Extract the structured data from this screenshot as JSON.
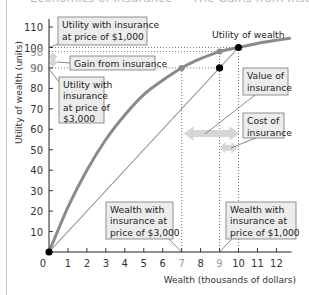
{
  "title_partial": "Economics of insurance — The Gains from Insurance",
  "chart_data": {
    "type": "line",
    "title": "The Gains from Insurance",
    "xlabel": "Wealth (thousands of dollars)",
    "ylabel": "Utility of wealth (units)",
    "xlim": [
      0,
      12.8
    ],
    "ylim": [
      0,
      115
    ],
    "x_ticks": [
      0,
      1,
      2,
      3,
      4,
      5,
      6,
      7,
      8,
      9,
      10,
      11,
      12
    ],
    "x_ticks_highlighted": [
      7,
      9
    ],
    "y_ticks": [
      10,
      20,
      30,
      40,
      50,
      60,
      70,
      80,
      90,
      100,
      110
    ],
    "y_ticks_highlighted": [
      90,
      98
    ],
    "grid": false,
    "series": [
      {
        "name": "Utility of wealth",
        "style": "thick gray curve",
        "x": [
          0,
          1,
          2,
          3,
          4,
          5,
          6,
          7,
          8,
          9,
          10,
          11,
          12,
          12.7
        ],
        "y": [
          0,
          22,
          40,
          55,
          67,
          77,
          84,
          90,
          94.5,
          98,
          100,
          102,
          103.5,
          104.5
        ]
      },
      {
        "name": "Expected utility line (no insurance)",
        "style": "thin gray straight line",
        "x": [
          0,
          10
        ],
        "y": [
          0,
          100
        ]
      }
    ],
    "points": [
      {
        "x": 0,
        "y": 0,
        "color": "black",
        "label": "origin"
      },
      {
        "x": 10,
        "y": 100,
        "color": "black",
        "label": "wealth without loss"
      },
      {
        "x": 9,
        "y": 90,
        "color": "black",
        "label": "expected utility without insurance"
      },
      {
        "x": 9,
        "y": 98,
        "color": "gray",
        "label": "utility with insurance at $1,000"
      },
      {
        "x": 7,
        "y": 90,
        "color": "gray",
        "label": "utility with insurance at $3,000"
      }
    ],
    "reference_lines": [
      {
        "type": "horizontal",
        "y": 100,
        "x_to": 10,
        "style": "dotted"
      },
      {
        "type": "horizontal",
        "y": 98,
        "x_to": 9,
        "style": "dotted"
      },
      {
        "type": "horizontal",
        "y": 90,
        "x_to": 9,
        "style": "dotted"
      },
      {
        "type": "vertical",
        "x": 7,
        "y_to": 90,
        "style": "dotted"
      },
      {
        "type": "vertical",
        "x": 9,
        "y_to": 98,
        "style": "dotted"
      },
      {
        "type": "vertical",
        "x": 10,
        "y_to": 100,
        "style": "dotted"
      }
    ],
    "arrows": [
      {
        "name": "Gain from insurance",
        "orientation": "vertical",
        "x": 0,
        "from": 90,
        "to": 98
      },
      {
        "name": "Value of insurance",
        "orientation": "horizontal",
        "y": 58,
        "from": 7,
        "to": 10
      },
      {
        "name": "Cost of insurance",
        "orientation": "horizontal",
        "y": 51,
        "from": 9,
        "to": 10
      }
    ],
    "annotations": [
      {
        "text": "Utility with insurance at price of $1,000"
      },
      {
        "text": "Gain from insurance"
      },
      {
        "text": "Utility with insurance at price of $3,000"
      },
      {
        "text": "Utility of wealth"
      },
      {
        "text": "Value of insurance"
      },
      {
        "text": "Cost of insurance"
      },
      {
        "text": "Wealth with insurance at price of $3,000"
      },
      {
        "text": "Wealth with insurance at price of $1,000"
      }
    ]
  },
  "labels": {
    "ylabel": "Utility of wealth (units)",
    "xlabel": "Wealth (thousands of dollars)",
    "curve_label": "Utility of wealth",
    "util_1000": [
      "Utility with insurance",
      "at price of $1,000"
    ],
    "gain": "Gain from insurance",
    "util_3000": [
      "Utility with",
      "insurance",
      "at price of",
      "$3,000"
    ],
    "value": [
      "Value of",
      "insurance"
    ],
    "cost": [
      "Cost of",
      "insurance"
    ],
    "wealth_3000": [
      "Wealth with",
      "insurance at",
      "price of $3,000"
    ],
    "wealth_1000": [
      "Wealth with",
      "insurance at",
      "price of $1,000"
    ]
  },
  "colors": {
    "curve": "#8a8a8a",
    "line": "#8a8a8a",
    "arrow": "#d6d6d6",
    "box_fill": "#ececec",
    "highlight_tick": "#9a9a9a",
    "point_black": "#000000",
    "point_gray": "#8a8a8a"
  }
}
